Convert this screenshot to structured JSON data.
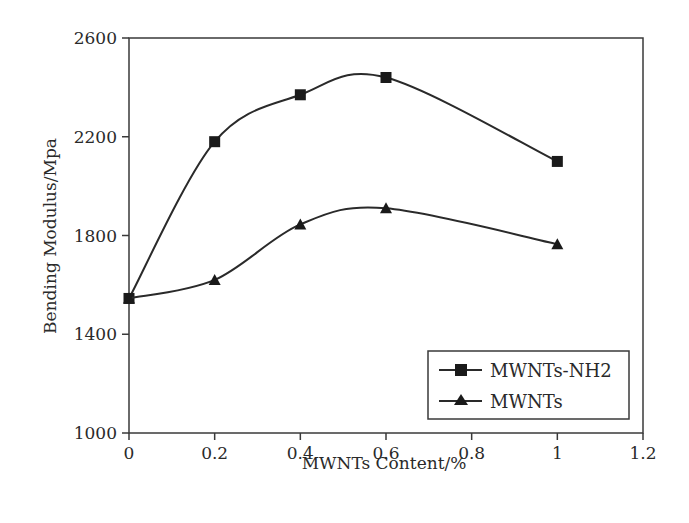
{
  "chart_data": {
    "type": "line",
    "title": "",
    "xlabel": "MWNTs Content/%",
    "ylabel": "Bending Modulus/Mpa",
    "xlim": [
      0,
      1.2
    ],
    "ylim": [
      1000,
      2600
    ],
    "x_ticks": [
      "0",
      "0.2",
      "0.4",
      "0.6",
      "0.8",
      "1",
      "1.2"
    ],
    "y_ticks": [
      "1000",
      "1400",
      "1800",
      "2200",
      "2600"
    ],
    "grid": false,
    "legend_position": "lower right",
    "smoothed": true,
    "x": [
      0,
      0.2,
      0.4,
      0.6,
      1.0
    ],
    "series": [
      {
        "name": "MWNTs-NH2",
        "marker": "square",
        "values": [
          1545,
          2180,
          2370,
          2440,
          2100
        ]
      },
      {
        "name": "MWNTs",
        "marker": "triangle",
        "values": [
          1545,
          1620,
          1845,
          1910,
          1765
        ]
      }
    ]
  },
  "legend": {
    "items": [
      "MWNTs-NH2",
      "MWNTs"
    ]
  },
  "colors": {
    "line": "#2a2a2a",
    "axis": "#3a3a3a",
    "background": "#ffffff"
  }
}
